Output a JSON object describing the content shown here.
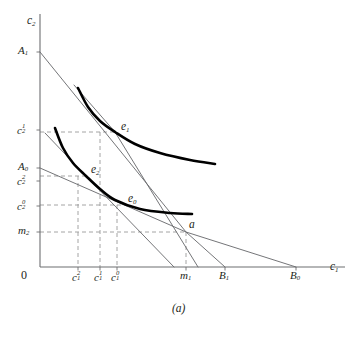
{
  "figure": {
    "caption": "(a)",
    "origin_label": "0",
    "axes": {
      "x_label": "c",
      "x_label_sub": "1",
      "y_label": "c",
      "y_label_sub": "2"
    },
    "colors": {
      "ink": "#231f20",
      "thin_line": "#6d6e71",
      "dashed": "#9a9a9a",
      "curve": "#000000",
      "background": "#ffffff"
    },
    "y_axis_ticks": [
      {
        "id": "A1",
        "base": "A",
        "sub": "1",
        "sup": "",
        "y": 52
      },
      {
        "id": "c2_1",
        "base": "c",
        "sub": "2",
        "sup": "1",
        "y": 130
      },
      {
        "id": "A0",
        "base": "A",
        "sub": "0",
        "sup": "",
        "y": 168
      },
      {
        "id": "c2_2",
        "base": "c",
        "sub": "2",
        "sup": "2",
        "y": 181
      },
      {
        "id": "c2_0",
        "base": "c",
        "sub": "2",
        "sup": "0",
        "y": 206
      },
      {
        "id": "m2",
        "base": "m",
        "sub": "2",
        "sup": "",
        "y": 232
      }
    ],
    "x_axis_ticks": [
      {
        "id": "c1_2",
        "base": "c",
        "sub": "1",
        "sup": "2",
        "x": 78
      },
      {
        "id": "c1_1",
        "base": "c",
        "sub": "1",
        "sup": "1",
        "x": 100
      },
      {
        "id": "c1_0",
        "base": "c",
        "sub": "1",
        "sup": "0",
        "x": 117
      },
      {
        "id": "m1",
        "base": "m",
        "sub": "1",
        "sup": "",
        "x": 186
      },
      {
        "id": "B1",
        "base": "B",
        "sub": "1",
        "sup": "",
        "x": 225
      },
      {
        "id": "B0",
        "base": "B",
        "sub": "0",
        "sup": "",
        "x": 296
      }
    ],
    "equilibrium_points": [
      {
        "id": "e1",
        "base": "e",
        "sub": "1",
        "x": 115,
        "y": 132
      },
      {
        "id": "e2",
        "base": "e",
        "sub": "2",
        "x": 86,
        "y": 176
      },
      {
        "id": "e0",
        "base": "e",
        "sub": "0",
        "x": 123,
        "y": 205
      },
      {
        "id": "a",
        "base": "a",
        "sub": "",
        "x": 186,
        "y": 232
      }
    ]
  },
  "chart_data": {
    "type": "line",
    "title": "(a)",
    "xlabel": "c1",
    "ylabel": "c2",
    "grid": false,
    "legend": "none",
    "axis_origin_px": {
      "x": 40,
      "y": 267
    },
    "axis_extent_px": {
      "x_max": 345,
      "y_min": 14
    },
    "budget_lines": [
      {
        "name": "B1 budget line",
        "from_label": "A1",
        "through": "e1",
        "to_label": "B1",
        "points_px": [
          [
            40,
            52
          ],
          [
            186,
            232
          ],
          [
            225,
            267
          ]
        ]
      },
      {
        "name": "B0 budget line",
        "from_label": "A0",
        "through": "e0",
        "to_label": "B0",
        "points_px": [
          [
            40,
            168
          ],
          [
            186,
            232
          ],
          [
            296,
            267
          ]
        ]
      },
      {
        "name": "compensated line through e2",
        "from_label": "A1-slope",
        "through": "e2",
        "to_label": "",
        "points_px": [
          [
            45,
            133
          ],
          [
            86,
            176
          ],
          [
            174,
            267
          ]
        ]
      },
      {
        "name": "steep ray to x-axis",
        "from_label": "",
        "through": "e1",
        "to_label": "",
        "points_px": [
          [
            74,
            85
          ],
          [
            115,
            132
          ],
          [
            198,
            267
          ]
        ]
      }
    ],
    "indifference_curves": [
      {
        "name": "U1 (higher)",
        "through": "e1",
        "points_px": [
          [
            78,
            88
          ],
          [
            88,
            107
          ],
          [
            100,
            121
          ],
          [
            115,
            132
          ],
          [
            135,
            144
          ],
          [
            160,
            153
          ],
          [
            190,
            160
          ],
          [
            215,
            164
          ]
        ]
      },
      {
        "name": "U0 (lower)",
        "through": [
          "e2",
          "e0"
        ],
        "points_px": [
          [
            55,
            128
          ],
          [
            63,
            148
          ],
          [
            73,
            163
          ],
          [
            86,
            176
          ],
          [
            100,
            189
          ],
          [
            115,
            200
          ],
          [
            140,
            209
          ],
          [
            170,
            213
          ],
          [
            192,
            214
          ]
        ]
      }
    ],
    "dashed_guides": [
      {
        "from_px": [
          40,
          132
        ],
        "to_px": [
          115,
          132
        ]
      },
      {
        "from_px": [
          40,
          176
        ],
        "to_px": [
          86,
          176
        ]
      },
      {
        "from_px": [
          40,
          205
        ],
        "to_px": [
          123,
          205
        ]
      },
      {
        "from_px": [
          40,
          232
        ],
        "to_px": [
          186,
          232
        ]
      },
      {
        "from_px": [
          78,
          176
        ],
        "to_px": [
          78,
          267
        ]
      },
      {
        "from_px": [
          100,
          132
        ],
        "to_px": [
          100,
          267
        ]
      },
      {
        "from_px": [
          117,
          205
        ],
        "to_px": [
          117,
          267
        ]
      },
      {
        "from_px": [
          186,
          232
        ],
        "to_px": [
          186,
          267
        ]
      }
    ]
  }
}
